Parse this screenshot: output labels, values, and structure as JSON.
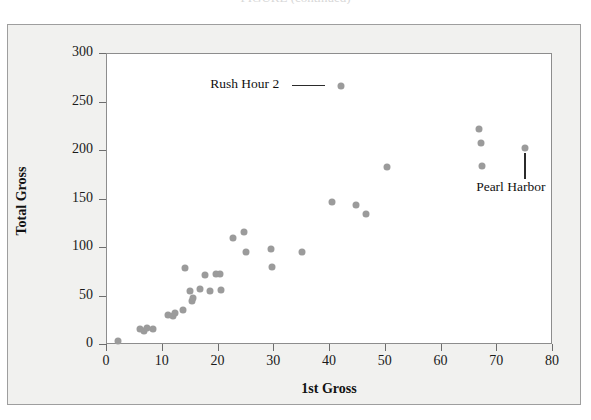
{
  "figure": {
    "cutoff_caption": "FIGURE  (continued)",
    "background_color": "#f1f1ef",
    "plot_background_color": "#ffffff",
    "marker_color": "#9b9b9b",
    "axis_color": "#8d8d8d"
  },
  "chart_data": {
    "type": "scatter",
    "title": "",
    "xlabel": "1st Gross",
    "ylabel": "Total Gross",
    "xlim": [
      0,
      80
    ],
    "ylim": [
      0,
      300
    ],
    "xticks": [
      0,
      10,
      20,
      30,
      40,
      50,
      60,
      70,
      80
    ],
    "yticks": [
      0,
      50,
      100,
      150,
      200,
      250,
      300
    ],
    "grid": false,
    "legend": "none",
    "points": [
      {
        "x": 2.0,
        "y": 4
      },
      {
        "x": 6.0,
        "y": 16
      },
      {
        "x": 6.6,
        "y": 14
      },
      {
        "x": 7.2,
        "y": 18
      },
      {
        "x": 8.2,
        "y": 17
      },
      {
        "x": 11.0,
        "y": 31
      },
      {
        "x": 11.8,
        "y": 30
      },
      {
        "x": 12.2,
        "y": 33
      },
      {
        "x": 13.6,
        "y": 36
      },
      {
        "x": 14.8,
        "y": 56
      },
      {
        "x": 15.2,
        "y": 45
      },
      {
        "x": 15.4,
        "y": 48
      },
      {
        "x": 16.6,
        "y": 58
      },
      {
        "x": 14.0,
        "y": 79
      },
      {
        "x": 17.6,
        "y": 72
      },
      {
        "x": 18.4,
        "y": 56
      },
      {
        "x": 19.6,
        "y": 73
      },
      {
        "x": 20.2,
        "y": 73
      },
      {
        "x": 20.4,
        "y": 57
      },
      {
        "x": 22.6,
        "y": 110
      },
      {
        "x": 24.6,
        "y": 117
      },
      {
        "x": 25.0,
        "y": 96
      },
      {
        "x": 29.4,
        "y": 99
      },
      {
        "x": 29.6,
        "y": 80
      },
      {
        "x": 35.0,
        "y": 96
      },
      {
        "x": 40.4,
        "y": 147
      },
      {
        "x": 42.0,
        "y": 267
      },
      {
        "x": 44.6,
        "y": 144
      },
      {
        "x": 46.4,
        "y": 135
      },
      {
        "x": 50.2,
        "y": 184
      },
      {
        "x": 66.8,
        "y": 223
      },
      {
        "x": 67.0,
        "y": 208
      },
      {
        "x": 67.2,
        "y": 185
      },
      {
        "x": 75.0,
        "y": 203
      }
    ],
    "annotations": [
      {
        "label": "Rush Hour 2",
        "point_x": 42.0,
        "point_y": 267,
        "leader": "horizontal"
      },
      {
        "label": "Pearl Harbor",
        "point_x": 75.0,
        "point_y": 203,
        "leader": "vertical"
      }
    ]
  }
}
